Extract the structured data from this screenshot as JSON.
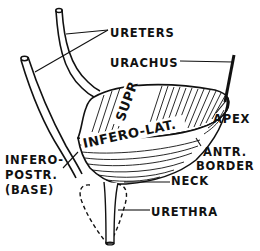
{
  "figure": {
    "colors": {
      "ink": "#111111",
      "background": "#ffffff"
    },
    "labels": {
      "ureters": "URETERS",
      "urachus": "URACHUS",
      "apex": "APEX",
      "antr_border_line1": "ANTR.",
      "antr_border_line2": "BORDER",
      "infero_postr_line1": "INFERO-",
      "infero_postr_line2": "POSTR.",
      "infero_postr_line3": "(BASE)",
      "neck": "NECK",
      "urethra": "URETHRA"
    },
    "surface_labels": {
      "superior": "SUPR",
      "infero_lateral": "INFERO-LAT."
    }
  }
}
